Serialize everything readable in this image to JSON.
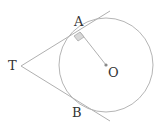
{
  "diagram": {
    "labels": {
      "T": "T",
      "A": "A",
      "B": "B",
      "O": "O"
    },
    "circle": {
      "center": [
        106,
        65
      ],
      "radius": 47
    },
    "points": {
      "T": [
        21,
        66
      ],
      "A": [
        80,
        32
      ],
      "B": [
        80,
        104
      ],
      "O": [
        106,
        65
      ]
    },
    "segments": [
      {
        "name": "tangent-TA",
        "from": [
          21,
          66
        ],
        "to": [
          110,
          11
        ]
      },
      {
        "name": "tangent-TB",
        "from": [
          21,
          66
        ],
        "to": [
          110,
          121
        ]
      },
      {
        "name": "radius-OA",
        "from": [
          106,
          65
        ],
        "to": [
          80,
          32
        ]
      }
    ],
    "right_angle_marker": "A",
    "colors": {
      "line": "#b0b0b0",
      "marker_fill": "#d8d8d8",
      "text": "#333333"
    }
  }
}
